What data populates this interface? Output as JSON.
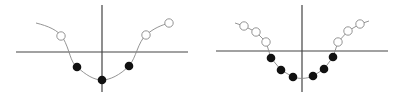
{
  "colors": {
    "background": "#ffffff",
    "axis": "#444444",
    "curve": "#888888",
    "filled_point": "#111111",
    "open_point_stroke": "#888888"
  },
  "diagrams": [
    {
      "name": "left-potential-well",
      "axes": {
        "h": [
          16,
          52,
          188,
          52
        ],
        "v": [
          102,
          5,
          102,
          92
        ]
      },
      "curve": "M36,23 C48,26 58,30 63,38 C70,50 70,62 77,67 C86,75 94,80 102,80 C110,80 120,75 129,66 C136,58 138,42 146,35 C154,28 162,25 169,23",
      "open_points": [
        [
          61,
          36
        ],
        [
          146,
          35
        ],
        [
          169,
          23
        ]
      ],
      "filled_points": [
        [
          77,
          67
        ],
        [
          102,
          80
        ],
        [
          129,
          66
        ]
      ]
    },
    {
      "name": "right-potential-well",
      "axes": {
        "h": [
          216,
          51,
          388,
          51
        ],
        "v": [
          302,
          5,
          302,
          92
        ]
      },
      "curve": "M235,23 L244,26 L256,32 L266,42 L271,58 L281,70 L293,77 C299,79 306,79 313,76 L324,69 L333,57 L338,42 L348,31 L360,24 L369,21",
      "open_points": [
        [
          244,
          26
        ],
        [
          256,
          32
        ],
        [
          266,
          42
        ],
        [
          338,
          42
        ],
        [
          348,
          31
        ],
        [
          360,
          24
        ]
      ],
      "filled_points": [
        [
          271,
          58
        ],
        [
          281,
          70
        ],
        [
          293,
          77
        ],
        [
          313,
          76
        ],
        [
          324,
          69
        ],
        [
          333,
          57
        ]
      ]
    }
  ]
}
